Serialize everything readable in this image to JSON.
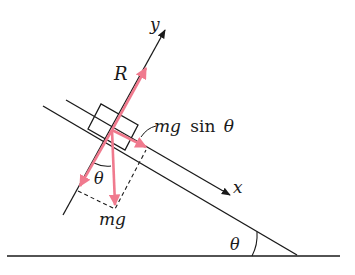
{
  "diagram": {
    "colors": {
      "line": "#1a1a1a",
      "force": "#f07a8e",
      "background": "#ffffff"
    },
    "labels": {
      "y_axis": "y",
      "x_axis": "x",
      "reaction": "R",
      "component_prefix": "mg",
      "component_func": "sin",
      "component_angle": "θ",
      "weight": "mg",
      "angle_inner": "θ",
      "angle_incline": "θ"
    }
  }
}
